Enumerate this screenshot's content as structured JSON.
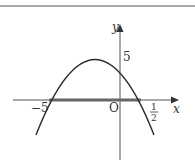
{
  "diagram": {
    "type": "parabola-graph",
    "axes": {
      "x_label": "x",
      "y_label": "y",
      "origin_label": "O"
    },
    "labels": {
      "left_root": "−5",
      "right_root_num": "1",
      "right_root_den": "2",
      "y_intercept": "5"
    },
    "curve": {
      "roots": [
        -5,
        0.5
      ],
      "y_intercept": 5,
      "opens": "down"
    },
    "highlight": "segment on x-axis from −5 to 1/2",
    "colors": {
      "curve": "#2a2a2a",
      "axis": "#555555",
      "segment": "#666666",
      "top_rule": "#a8a8a8"
    }
  }
}
